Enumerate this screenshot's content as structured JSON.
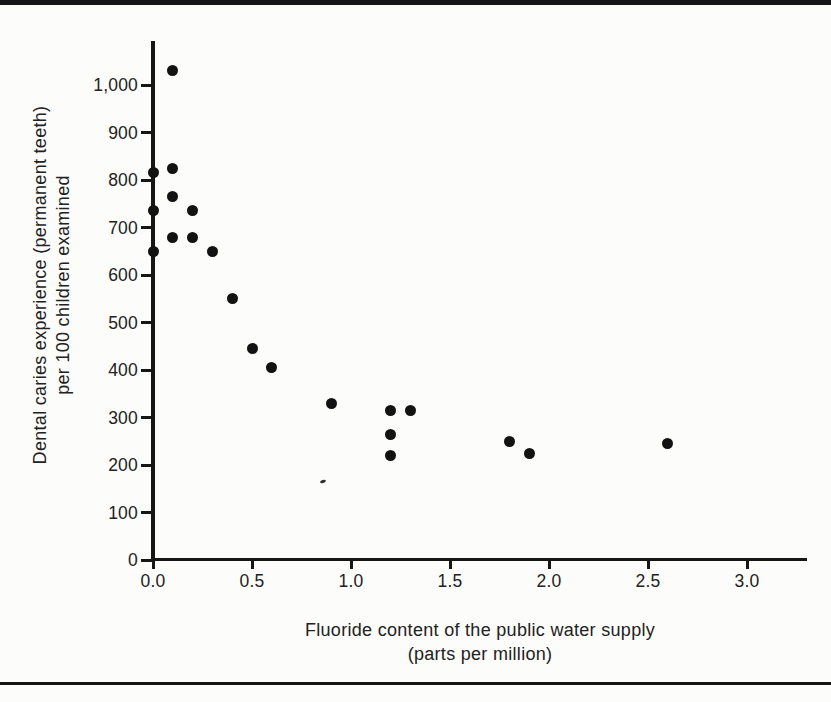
{
  "figure": {
    "background_color": "#fcfcfa",
    "ink_color": "#161616",
    "frame_rule_color": "#151515"
  },
  "chart_data": {
    "type": "scatter",
    "title": "",
    "xlabel": "Fluoride content of the public water supply",
    "xlabel_sub": "(parts per million)",
    "ylabel": "Dental caries experience (permanent teeth)",
    "ylabel_sub": "per 100 children examined",
    "xlim": [
      0,
      3.3
    ],
    "ylim": [
      0,
      1090
    ],
    "grid": false,
    "legend_position": "none",
    "marker": "filled-circle",
    "marker_color": "#121212",
    "x_tick_values": [
      0,
      0.5,
      1,
      1.5,
      2,
      2.5,
      3
    ],
    "x_tick_labels": [
      "0.0",
      "0.5",
      "1.0",
      "1.5",
      "2.0",
      "2.5",
      "3.0"
    ],
    "y_tick_values": [
      0,
      100,
      200,
      300,
      400,
      500,
      600,
      700,
      800,
      900,
      1000
    ],
    "y_tick_labels": [
      "0",
      "100",
      "200",
      "300",
      "400",
      "500",
      "600",
      "700",
      "800",
      "900",
      "1,000"
    ],
    "points": [
      {
        "x": 0.1,
        "y": 1030
      },
      {
        "x": 0.1,
        "y": 825
      },
      {
        "x": 0.0,
        "y": 815
      },
      {
        "x": 0.1,
        "y": 765
      },
      {
        "x": 0.0,
        "y": 735
      },
      {
        "x": 0.2,
        "y": 735
      },
      {
        "x": 0.1,
        "y": 680
      },
      {
        "x": 0.2,
        "y": 680
      },
      {
        "x": 0.0,
        "y": 650
      },
      {
        "x": 0.3,
        "y": 650
      },
      {
        "x": 0.4,
        "y": 550
      },
      {
        "x": 0.5,
        "y": 445
      },
      {
        "x": 0.6,
        "y": 405
      },
      {
        "x": 0.9,
        "y": 330
      },
      {
        "x": 1.2,
        "y": 315
      },
      {
        "x": 1.3,
        "y": 315
      },
      {
        "x": 1.2,
        "y": 265
      },
      {
        "x": 1.2,
        "y": 220
      },
      {
        "x": 1.8,
        "y": 250
      },
      {
        "x": 1.9,
        "y": 225
      },
      {
        "x": 2.6,
        "y": 245
      }
    ]
  }
}
